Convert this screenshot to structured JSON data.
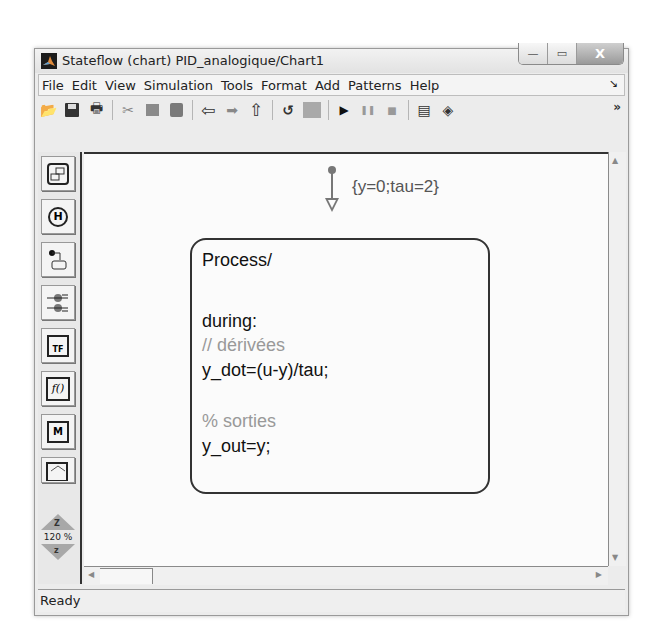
{
  "window": {
    "title": "Stateflow (chart) PID_analogique/Chart1",
    "buttons": {
      "minimize": "—",
      "maximize": "▭",
      "close": "X"
    }
  },
  "menu": {
    "items": [
      "File",
      "Edit",
      "View",
      "Simulation",
      "Tools",
      "Format",
      "Add",
      "Patterns",
      "Help"
    ],
    "corner": "↘"
  },
  "toolbar": {
    "buttons": [
      {
        "name": "open-icon",
        "glyph": "📂"
      },
      {
        "name": "save-icon",
        "glyph": "💾"
      },
      {
        "name": "print-icon",
        "glyph": "🖶"
      },
      {
        "name": "cut-icon",
        "glyph": "✂"
      },
      {
        "name": "copy-icon",
        "glyph": "⧉"
      },
      {
        "name": "paste-icon",
        "glyph": "📋"
      },
      {
        "name": "back-icon",
        "glyph": "⇦"
      },
      {
        "name": "forward-icon",
        "glyph": "➡"
      },
      {
        "name": "up-icon",
        "glyph": "⇧"
      },
      {
        "name": "undo-icon",
        "glyph": "↺"
      },
      {
        "name": "model-explorer-icon",
        "glyph": "▦"
      },
      {
        "name": "start-simulation-icon",
        "glyph": "▶"
      },
      {
        "name": "pause-simulation-icon",
        "glyph": "❚❚"
      },
      {
        "name": "stop-simulation-icon",
        "glyph": "■"
      },
      {
        "name": "debugger-icon",
        "glyph": "▤"
      },
      {
        "name": "library-browser-icon",
        "glyph": "◈"
      }
    ],
    "more": "»"
  },
  "palette": {
    "tools": [
      "state-tool",
      "history-junction-tool",
      "default-transition-tool",
      "connective-junction-tool",
      "truth-table-tool",
      "function-tool",
      "embedded-matlab-tool",
      "box-tool"
    ],
    "history_label": "H",
    "truth_table_label": "TF",
    "function_label": "f()",
    "zoom_in_label": "Z",
    "zoom_percent": "120 %",
    "zoom_out_label": "z"
  },
  "chart": {
    "default_transition_label": "{y=0;tau=2}",
    "state": {
      "name": "Process/",
      "lines": [
        {
          "text": "during:",
          "type": "code"
        },
        {
          "text": "// dérivées",
          "type": "comment"
        },
        {
          "text": "y_dot=(u-y)/tau;",
          "type": "code"
        },
        {
          "text": "% sorties",
          "type": "comment"
        },
        {
          "text": "y_out=y;",
          "type": "code"
        }
      ]
    }
  },
  "scroll": {
    "up": "▲",
    "down": "▼",
    "left": "◀",
    "right": "▶"
  },
  "status": {
    "text": "Ready"
  }
}
